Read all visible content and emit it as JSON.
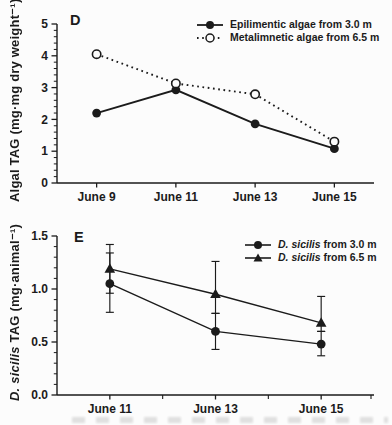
{
  "page": {
    "background": "#fcfcfc",
    "ink": "#1b1b1b"
  },
  "chart_data": [
    {
      "type": "line",
      "panel_label": "D",
      "ylabel": "Algal TAG (mg·mg dry weight⁻¹)",
      "categories": [
        "June 9",
        "June 11",
        "June 13",
        "June 15"
      ],
      "ylim": [
        0,
        5
      ],
      "yticks": [
        0,
        1,
        2,
        3,
        4,
        5
      ],
      "ytick_labels": [
        "0",
        "1",
        "2",
        "3",
        "4",
        "5"
      ],
      "y_minor_step": 0.2,
      "x_minor": false,
      "grid": false,
      "legend_position": "top-right-inside",
      "series": [
        {
          "name": "Epilimentic algae from 3.0 m",
          "marker": "circle-filled",
          "line": "solid",
          "values": [
            2.2,
            2.93,
            1.86,
            1.08
          ]
        },
        {
          "name": "Metalimnetic algae from 6.5 m",
          "marker": "circle-open",
          "line": "dotted",
          "values": [
            4.05,
            3.13,
            2.79,
            1.3
          ]
        }
      ]
    },
    {
      "type": "line",
      "panel_label": "E",
      "ylabel_italic": "D. sicilis",
      "ylabel_rest": " TAG (mg·animal⁻¹)",
      "categories": [
        "June 11",
        "June 13",
        "June 15"
      ],
      "ylim": [
        0,
        1.5
      ],
      "yticks": [
        0,
        0.5,
        1.0,
        1.5
      ],
      "ytick_labels": [
        "0.0",
        "0.5",
        "1.0",
        "1.5"
      ],
      "y_minor_step": 0.1,
      "x_minor": true,
      "grid": false,
      "legend_position": "top-right-inside",
      "series": [
        {
          "name_italic": "D. sicilis",
          "name_rest": " from 3.0 m",
          "marker": "circle-filled",
          "line": "solid",
          "values": [
            1.05,
            0.6,
            0.48
          ],
          "err_low": [
            0.78,
            0.43,
            0.37
          ],
          "err_high": [
            1.34,
            0.77,
            0.6
          ]
        },
        {
          "name_italic": "D. sicilis",
          "name_rest": " from 6.5 m",
          "marker": "triangle-filled",
          "line": "solid",
          "values": [
            1.19,
            0.95,
            0.68
          ],
          "err_low": [
            0.96,
            0.77,
            0.6
          ],
          "err_high": [
            1.42,
            1.26,
            0.93
          ]
        }
      ]
    }
  ]
}
